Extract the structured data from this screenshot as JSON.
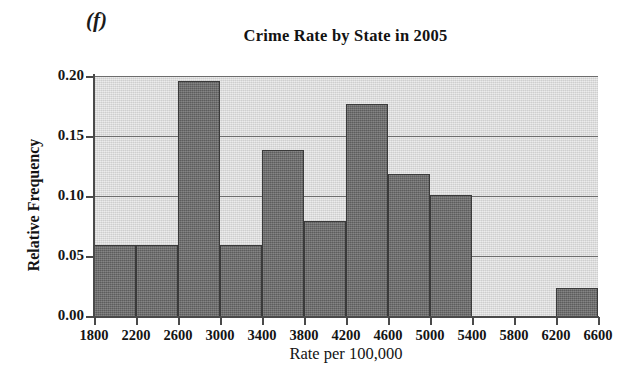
{
  "figure": {
    "panel_label": "(f)",
    "background_color": "#ffffff",
    "plot_background_color": "#dcdcdc",
    "bar_color": "#6b6b6b",
    "bar_edge_color": "#3a3a3a",
    "axis_color": "#4a4a4a",
    "gridline_color": "#6d6d6d"
  },
  "chart_data": {
    "type": "bar",
    "title": "Crime Rate by State in 2005",
    "xlabel": "Rate per 100,000",
    "ylabel": "Relative Frequency",
    "grid": true,
    "legend": null,
    "xlim": [
      1800,
      6600
    ],
    "ylim": [
      0.0,
      0.2
    ],
    "bin_width": 400,
    "bin_edges": [
      1800,
      2200,
      2600,
      3000,
      3400,
      3800,
      4200,
      4600,
      5000,
      5400,
      5800,
      6200,
      6600
    ],
    "xticks": [
      1800,
      2200,
      2600,
      3000,
      3400,
      3800,
      4200,
      4600,
      5000,
      5400,
      5800,
      6200,
      6600
    ],
    "xtick_labels": [
      "1800",
      "2200",
      "2600",
      "3000",
      "3400",
      "3800",
      "4200",
      "4600",
      "5000",
      "5400",
      "5800",
      "6200",
      "6600"
    ],
    "yticks": [
      0.0,
      0.05,
      0.1,
      0.15,
      0.2
    ],
    "ytick_labels": [
      "0.00",
      "0.05",
      "0.10",
      "0.15",
      "0.20"
    ],
    "categories": [
      "1800-2200",
      "2200-2600",
      "2600-3000",
      "3000-3400",
      "3400-3800",
      "3800-4200",
      "4200-4600",
      "4600-5000",
      "5000-5400",
      "5400-5800",
      "5800-6200",
      "6200-6600"
    ],
    "values": [
      0.059,
      0.059,
      0.196,
      0.059,
      0.138,
      0.079,
      0.177,
      0.118,
      0.101,
      0.0,
      0.0,
      0.023
    ]
  }
}
